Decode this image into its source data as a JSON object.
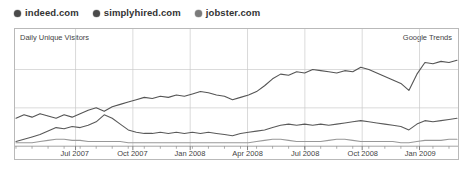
{
  "legend": {
    "items": [
      {
        "label": "indeed.com",
        "icon": "filled-circle-marker",
        "color": "#4a4a4a"
      },
      {
        "label": "simplyhired.com",
        "icon": "filled-circle-marker",
        "color": "#4a4a4a"
      },
      {
        "label": "jobster.com",
        "icon": "filled-circle-marker",
        "color": "#7a7a7a"
      }
    ]
  },
  "chart_data": {
    "type": "line",
    "title": "Daily Unique Visitors",
    "subtitle": "Google Trends",
    "xlabel": "",
    "ylabel": "Daily Unique Visitors",
    "grid": true,
    "legend_position": "above-top-left",
    "xlim": [
      "2007-04",
      "2009-03"
    ],
    "ylim": [
      0,
      100
    ],
    "x_tick_labels": [
      "Jul 2007",
      "Oct 2007",
      "Jan 2008",
      "Apr 2008",
      "Jul 2008",
      "Oct 2008",
      "Jan 2009"
    ],
    "x_tick_positions_pct": [
      13.5,
      26.5,
      39.5,
      52.5,
      65.5,
      78.5,
      91.5
    ],
    "y_gridline_values": [
      33,
      66
    ],
    "series": [
      {
        "name": "indeed.com",
        "color": "#555555",
        "values": [
          24,
          27,
          25,
          28,
          26,
          24,
          27,
          25,
          28,
          31,
          33,
          30,
          34,
          36,
          38,
          40,
          42,
          41,
          43,
          42,
          44,
          43,
          45,
          47,
          46,
          44,
          43,
          40,
          42,
          44,
          47,
          52,
          58,
          62,
          61,
          64,
          63,
          66,
          65,
          64,
          63,
          65,
          64,
          68,
          66,
          63,
          60,
          57,
          54,
          48,
          62,
          72,
          71,
          73,
          72,
          74
        ]
      },
      {
        "name": "simplyhired.com",
        "color": "#5a5a5a",
        "values": [
          4,
          6,
          8,
          10,
          13,
          16,
          15,
          17,
          16,
          18,
          21,
          27,
          24,
          19,
          14,
          12,
          11,
          11,
          12,
          11,
          12,
          11,
          12,
          11,
          12,
          11,
          10,
          9,
          11,
          12,
          13,
          14,
          16,
          18,
          19,
          18,
          19,
          18,
          19,
          18,
          19,
          20,
          21,
          22,
          21,
          20,
          19,
          18,
          17,
          14,
          19,
          22,
          21,
          22,
          23,
          24
        ]
      },
      {
        "name": "jobster.com",
        "color": "#999999",
        "values": [
          3,
          3,
          3,
          4,
          5,
          6,
          6,
          5,
          5,
          4,
          4,
          4,
          4,
          4,
          3,
          3,
          3,
          3,
          3,
          3,
          3,
          3,
          3,
          3,
          3,
          3,
          3,
          3,
          3,
          3,
          4,
          5,
          6,
          6,
          5,
          4,
          4,
          4,
          4,
          5,
          6,
          6,
          5,
          4,
          4,
          4,
          4,
          4,
          3,
          3,
          4,
          5,
          5,
          5,
          6,
          6
        ]
      }
    ]
  }
}
